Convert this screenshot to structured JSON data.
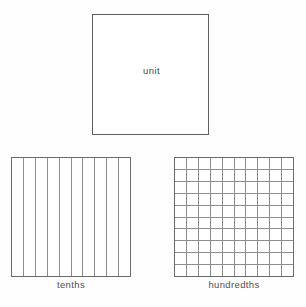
{
  "figure": {
    "background_color": "#fefefe",
    "line_color": "#8d8d8d",
    "border_color": "#6a6a6a",
    "text_color": "#4f4f4f"
  },
  "blocks": {
    "unit": {
      "label": "unit",
      "rows": 1,
      "columns": 1,
      "divisions": 1,
      "subdivided": false
    },
    "tenths": {
      "label": "tenths",
      "rows": 1,
      "columns": 10,
      "divisions": 10,
      "subdivided": true
    },
    "hundredths": {
      "label": "hundredths",
      "rows": 10,
      "columns": 10,
      "divisions": 100,
      "subdivided": true
    }
  },
  "chart_data": {
    "type": "diagram",
    "categories": [
      "unit",
      "tenths",
      "hundredths"
    ],
    "values": [
      1,
      10,
      100
    ],
    "series": [
      {
        "name": "divisions",
        "values": [
          1,
          10,
          100
        ]
      },
      {
        "name": "rows",
        "values": [
          1,
          1,
          10
        ]
      },
      {
        "name": "columns",
        "values": [
          1,
          10,
          10
        ]
      }
    ],
    "xlabel": "",
    "ylabel": "",
    "legend": [],
    "grid": true,
    "annotations": [
      "unit",
      "tenths",
      "hundredths"
    ]
  }
}
